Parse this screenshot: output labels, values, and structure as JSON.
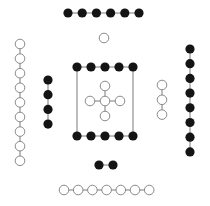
{
  "diagram": {
    "colors": {
      "filled": "#141414",
      "hollow_fill": "#ffffff",
      "hollow_stroke": "#8a8a8a",
      "edge": "#7a7a7a"
    },
    "node_radius_filled": 4.6,
    "node_radius_hollow": 4.8,
    "groups": [
      {
        "name": "top-filled-row",
        "type": "filled",
        "orientation": "horizontal",
        "x0": 68,
        "y0": 13,
        "step": 14.2,
        "count": 6
      },
      {
        "name": "single-hollow-node",
        "type": "hollow",
        "orientation": "horizontal",
        "x0": 104,
        "y0": 38,
        "step": 0,
        "count": 1
      },
      {
        "name": "left-hollow-column",
        "type": "hollow",
        "orientation": "vertical",
        "x0": 20,
        "y0": 44,
        "step": 14.6,
        "count": 9
      },
      {
        "name": "left-filled-column",
        "type": "filled",
        "orientation": "vertical",
        "x0": 48,
        "y0": 80,
        "step": 14.7,
        "count": 4
      },
      {
        "name": "box-top-filled-row",
        "type": "filled",
        "orientation": "horizontal",
        "x0": 77,
        "y0": 67,
        "step": 14,
        "count": 5
      },
      {
        "name": "box-bottom-filled-row",
        "type": "filled",
        "orientation": "horizontal",
        "x0": 77,
        "y0": 136,
        "step": 14,
        "count": 5
      },
      {
        "name": "right-hollow-column",
        "type": "hollow",
        "orientation": "vertical",
        "x0": 162,
        "y0": 85,
        "step": 14.8,
        "count": 3
      },
      {
        "name": "right-filled-column",
        "type": "filled",
        "orientation": "vertical",
        "x0": 190,
        "y0": 49,
        "step": 14.7,
        "count": 8
      },
      {
        "name": "bottom-filled-pair",
        "type": "filled",
        "orientation": "horizontal",
        "x0": 99,
        "y0": 165,
        "step": 14,
        "count": 2
      },
      {
        "name": "bottom-hollow-row",
        "type": "hollow",
        "orientation": "horizontal",
        "x0": 64,
        "y0": 190,
        "step": 14.2,
        "count": 7
      }
    ],
    "box_edges": [
      {
        "name": "box-left-edge",
        "x1": 77,
        "y1": 67,
        "x2": 77,
        "y2": 136
      },
      {
        "name": "box-right-edge",
        "x1": 133,
        "y1": 67,
        "x2": 133,
        "y2": 136
      }
    ],
    "cross": {
      "name": "center-cross",
      "cx": 105,
      "cy": 101,
      "arm": 15
    }
  }
}
